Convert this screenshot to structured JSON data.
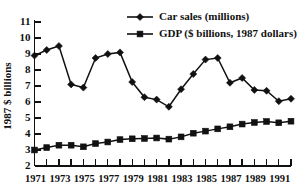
{
  "chart_data": {
    "type": "line",
    "title": "",
    "xlabel": "",
    "ylabel": "1987 $ billions",
    "ylim": [
      2,
      11
    ],
    "xlim": [
      1971,
      1992
    ],
    "grid": false,
    "legend_position": "top-right",
    "yticks": [
      "2",
      "3",
      "4",
      "5",
      "6",
      "7",
      "8",
      "9",
      "10",
      "11"
    ],
    "ytick_values": [
      2,
      3,
      4,
      5,
      6,
      7,
      8,
      9,
      10,
      11
    ],
    "xticks": [
      "1971",
      "1973",
      "1975",
      "1977",
      "1979",
      "1981",
      "1983",
      "1985",
      "1987",
      "1989",
      "1991"
    ],
    "xtick_values": [
      1971,
      1973,
      1975,
      1977,
      1979,
      1981,
      1983,
      1985,
      1987,
      1989,
      1991
    ],
    "x": [
      1971,
      1972,
      1973,
      1974,
      1975,
      1976,
      1977,
      1978,
      1979,
      1980,
      1981,
      1982,
      1983,
      1984,
      1985,
      1986,
      1987,
      1988,
      1989,
      1990,
      1991,
      1992
    ],
    "series": [
      {
        "name": "Car sales (millions)",
        "marker": "diamond",
        "color": "#111111",
        "values": [
          8.9,
          9.25,
          9.5,
          7.1,
          6.9,
          8.75,
          9.0,
          9.1,
          7.25,
          6.3,
          6.15,
          5.7,
          6.8,
          7.75,
          8.65,
          8.75,
          7.2,
          7.5,
          6.75,
          6.7,
          6.05,
          6.2
        ]
      },
      {
        "name": "GDP ($ billions, 1987 dollars)",
        "marker": "square",
        "color": "#111111",
        "values": [
          3.0,
          3.15,
          3.3,
          3.3,
          3.2,
          3.4,
          3.5,
          3.65,
          3.7,
          3.72,
          3.75,
          3.68,
          3.82,
          4.05,
          4.18,
          4.32,
          4.45,
          4.62,
          4.72,
          4.78,
          4.7,
          4.8
        ]
      }
    ]
  },
  "legend": {
    "entries": [
      {
        "label": "Car sales (millions)",
        "marker": "diamond-marker"
      },
      {
        "label": "GDP ($ billions, 1987 dollars)",
        "marker": "square-marker"
      }
    ]
  },
  "axis": {
    "y_title": "1987 $ billions"
  }
}
